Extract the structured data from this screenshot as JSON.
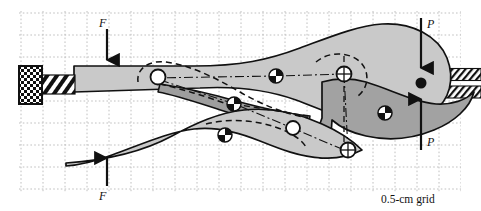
{
  "figure": {
    "caption": "0.5-cm grid",
    "grid": {
      "spacing_px": 22.0,
      "origin_x": 21,
      "origin_y": 13,
      "cols": 20,
      "rows": 8,
      "style": "dotted",
      "color": "#b9b9b9",
      "label": "0.5-cm grid"
    },
    "colors": {
      "body_light": "#c9c9c9",
      "body_mid": "#bdbdbd",
      "body_dark": "#a2a2a2",
      "outline": "#111111",
      "grid": "#b9b9b9",
      "white": "#ffffff",
      "black": "#000000"
    }
  },
  "forces": [
    {
      "name": "applied-force-upper",
      "label": "F",
      "direction": "down",
      "tail_x": 107,
      "tail_y": 31,
      "head_x": 107,
      "head_y": 66,
      "label_x": 101,
      "label_y": 26
    },
    {
      "name": "applied-force-lower",
      "label": "F",
      "direction": "up",
      "tail_x": 107,
      "tail_y": 184,
      "head_x": 107,
      "head_y": 152,
      "label_x": 101,
      "label_y": 198
    },
    {
      "name": "reaction-force-upper",
      "label": "P",
      "direction": "down",
      "tail_x": 421,
      "tail_y": 20,
      "head_x": 421,
      "head_y": 73,
      "label_x": 427,
      "label_y": 27
    },
    {
      "name": "reaction-force-lower",
      "label": "P",
      "direction": "up",
      "tail_x": 421,
      "tail_y": 148,
      "head_x": 421,
      "head_y": 93,
      "label_x": 427,
      "label_y": 144
    }
  ],
  "pins": [
    {
      "name": "pin-upper-left",
      "x": 158,
      "y": 77,
      "r": 7.5,
      "style": "hollow"
    },
    {
      "name": "pin-mid-upper",
      "x": 276,
      "y": 76,
      "r": 7.0,
      "style": "quadrant"
    },
    {
      "name": "pin-upper-right",
      "x": 344,
      "y": 74,
      "r": 7.5,
      "style": "crosshair"
    },
    {
      "name": "pin-toggle-mid",
      "x": 234,
      "y": 104,
      "r": 7.0,
      "style": "quadrant"
    },
    {
      "name": "pin-lower-left",
      "x": 225,
      "y": 135,
      "r": 7.0,
      "style": "quadrant"
    },
    {
      "name": "pin-lower-mid",
      "x": 293,
      "y": 128,
      "r": 7.0,
      "style": "hollow"
    },
    {
      "name": "pin-jaw-right",
      "x": 385,
      "y": 113,
      "r": 7.0,
      "style": "quadrant"
    },
    {
      "name": "pin-jaw-pivot",
      "x": 348,
      "y": 150,
      "r": 7.5,
      "style": "crosshair"
    }
  ],
  "components": [
    {
      "name": "adjusting-knob",
      "type": "checkered-block",
      "x": 20,
      "y": 66,
      "w": 22,
      "h": 38
    },
    {
      "name": "adjusting-screw",
      "type": "hatched-shaft",
      "x": 42,
      "y": 75,
      "w": 32,
      "h": 20
    },
    {
      "name": "upper-handle",
      "type": "body-light"
    },
    {
      "name": "lower-handle",
      "type": "body-light"
    },
    {
      "name": "toggle-link",
      "type": "body-dark"
    },
    {
      "name": "movable-jaw",
      "type": "body-dark"
    },
    {
      "name": "workpiece-upper-bar",
      "type": "hatched-bar",
      "x": 350,
      "y": 69,
      "w": 131,
      "h": 12
    },
    {
      "name": "workpiece-lower-bar",
      "type": "hatched-bar",
      "x": 350,
      "y": 86,
      "w": 131,
      "h": 12
    },
    {
      "name": "contact-point",
      "type": "filled-dot",
      "x": 421,
      "y": 83,
      "r": 5.5
    }
  ],
  "construction_lines": [
    {
      "name": "centerline-dashdot-upper",
      "style": "dash-dot"
    },
    {
      "name": "phantom-outline-dashed",
      "style": "dashed"
    }
  ]
}
